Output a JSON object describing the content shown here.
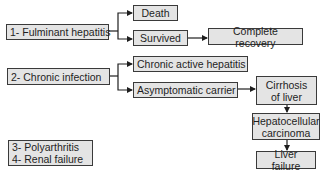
{
  "diagram": {
    "type": "flowchart",
    "nodes": {
      "fulminant": {
        "label": "1- Fulminant hepatitis"
      },
      "death": {
        "label": "Death"
      },
      "survived": {
        "label": "Survived"
      },
      "complete_recovery": {
        "label": "Complete recovery"
      },
      "chronic_infection": {
        "label": "2- Chronic infection"
      },
      "chronic_active": {
        "label": "Chronic active hepatitis"
      },
      "asymptomatic": {
        "label": "Asymptomatic carrier"
      },
      "cirrhosis": {
        "line1": "Cirrhosis",
        "line2": "of liver"
      },
      "hcc": {
        "line1": "Hepatocellular",
        "line2": "carcinoma"
      },
      "liver_failure": {
        "label": "Liver failure"
      },
      "others": {
        "line1": "3- Polyarthritis",
        "line2": "4- Renal failure"
      }
    },
    "edges": [
      {
        "from": "1- Fulminant hepatitis",
        "to": "Death"
      },
      {
        "from": "1- Fulminant hepatitis",
        "to": "Survived"
      },
      {
        "from": "Survived",
        "to": "Complete recovery"
      },
      {
        "from": "2- Chronic infection",
        "to": "Chronic active hepatitis"
      },
      {
        "from": "2- Chronic infection",
        "to": "Asymptomatic carrier"
      },
      {
        "from": "Asymptomatic carrier",
        "to": "Cirrhosis of liver"
      },
      {
        "from": "Cirrhosis of liver",
        "to": "Hepatocellular carcinoma"
      },
      {
        "from": "Hepatocellular carcinoma",
        "to": "Liver failure"
      }
    ],
    "colors": {
      "box_fill": "#e4e4e4",
      "box_border": "#3a3a3a",
      "line": "#1e1e1e",
      "background": "#ffffff"
    }
  }
}
